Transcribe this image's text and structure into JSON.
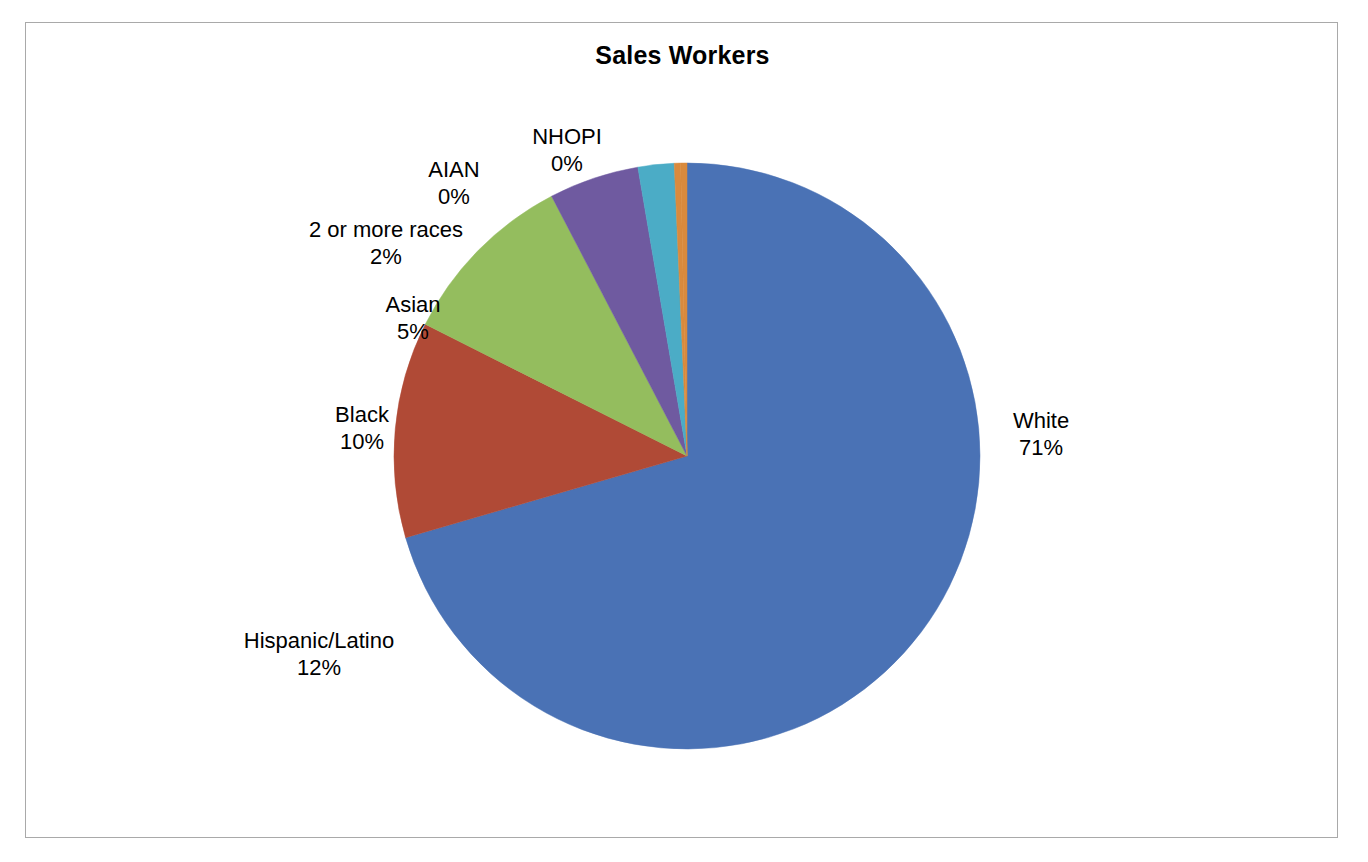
{
  "chart_data": {
    "type": "pie",
    "title": "Sales Workers",
    "xlabel": "",
    "ylabel": "",
    "legend_position": "none",
    "grid": false,
    "labels_show_percent": true,
    "start_angle_deg": 0,
    "direction": "clockwise",
    "categories": [
      "White",
      "Hispanic/Latino",
      "Black",
      "Asian",
      "2 or more races",
      "AIAN",
      "NHOPI"
    ],
    "values": [
      71,
      12,
      10,
      5,
      2,
      0,
      0
    ],
    "value_labels": [
      "71%",
      "12%",
      "10%",
      "5%",
      "2%",
      "0%",
      "0%"
    ],
    "colors": [
      "#4A72B5",
      "#B04A36",
      "#94BD5E",
      "#6F5AA0",
      "#4BACC6",
      "#D98A3D",
      "#D98A3D"
    ],
    "slices": [
      {
        "name": "White",
        "value": 71,
        "value_label": "71%",
        "color": "#4A72B5"
      },
      {
        "name": "Hispanic/Latino",
        "value": 12,
        "value_label": "12%",
        "color": "#B04A36"
      },
      {
        "name": "Black",
        "value": 10,
        "value_label": "10%",
        "color": "#94BD5E"
      },
      {
        "name": "Asian",
        "value": 5,
        "value_label": "5%",
        "color": "#6F5AA0"
      },
      {
        "name": "2 or more races",
        "value": 2,
        "value_label": "2%",
        "color": "#4BACC6"
      },
      {
        "name": "AIAN",
        "value": 0,
        "value_label": "0%",
        "color": "#D98A3D"
      },
      {
        "name": "NHOPI",
        "value": 0,
        "value_label": "0%",
        "color": "#D98A3D"
      }
    ]
  },
  "figure": {
    "title": "Sales Workers",
    "border_color": "#a9a9a9",
    "background": "#ffffff"
  }
}
